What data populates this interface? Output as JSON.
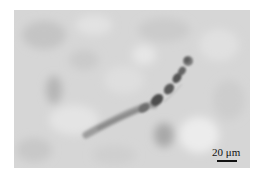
{
  "figure": {
    "type": "brightfield micrograph",
    "colors": {
      "background": "#d9d9d9",
      "filament_dark": "#4a4a4a",
      "filament_mid": "#8a8a8a",
      "page": "#ffffff"
    },
    "scale_bar": {
      "label": "20 μm",
      "color": "#111111"
    }
  }
}
